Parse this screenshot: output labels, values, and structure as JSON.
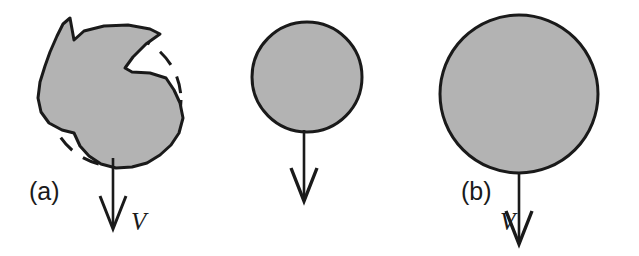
{
  "figure": {
    "background_color": "#ffffff",
    "fill_color": "#b3b3b3",
    "stroke_color": "#1a1a1a",
    "width": 639,
    "height": 256
  },
  "panels": [
    {
      "id": "a",
      "label": "(a)",
      "shape": "irregular-blob-with-dashed-circle",
      "velocity_label": "V",
      "dashed_circle": {
        "cx": 115,
        "cy": 100,
        "r": 66
      },
      "arrow": {
        "x": 113,
        "y_start": 158,
        "y_end": 228
      }
    },
    {
      "id": "b",
      "label": "(b)",
      "shape": "circle",
      "velocity_label": "V",
      "circle": {
        "cx": 307,
        "cy": 77,
        "r": 55
      },
      "arrow": {
        "x": 304,
        "y_start": 132,
        "y_end": 200
      }
    },
    {
      "id": "c",
      "label": "(c)",
      "shape": "circle",
      "velocity_label": "V",
      "circle": {
        "cx": 519,
        "cy": 94,
        "r": 79
      },
      "arrow": {
        "x": 519,
        "y_start": 173,
        "y_end": 243
      }
    }
  ]
}
